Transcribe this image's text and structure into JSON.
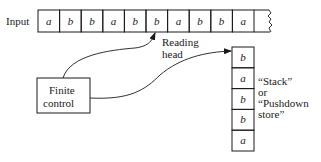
{
  "input_label": "Input",
  "tape": {
    "cells": [
      "a",
      "b",
      "b",
      "a",
      "b",
      "b",
      "a",
      "b",
      "b",
      "a"
    ],
    "head_index": 5,
    "continues": true
  },
  "reading_head_label": [
    "Reading",
    "head"
  ],
  "finite_control_label": [
    "Finite",
    "control"
  ],
  "stack": {
    "cells_top_to_bottom": [
      "b",
      "a",
      "b",
      "b",
      "a"
    ]
  },
  "stack_label": [
    "“Stack”",
    "or",
    "“Pushdown",
    "store”"
  ],
  "colors": {
    "ink": "#1a1a1a",
    "background": "#ffffff"
  }
}
